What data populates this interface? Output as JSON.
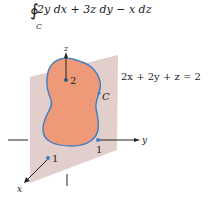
{
  "integral": {
    "symbol": "∮",
    "expression": "2y dx + 3z dy − x dz",
    "subscript": "C"
  },
  "plane": {
    "equation": "2x + 2y + z = 2",
    "color": "#e2cfcc"
  },
  "region": {
    "fill_color": "#ee9a78",
    "boundary_color": "#3d7fc4",
    "boundary_label": "C"
  },
  "axes": {
    "x_label": "x",
    "y_label": "y",
    "z_label": "z"
  },
  "intercepts": {
    "x": "1",
    "y": "1",
    "z": "2"
  }
}
